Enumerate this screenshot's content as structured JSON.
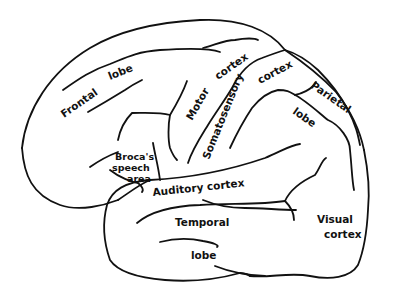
{
  "diagram": {
    "ink_color": "#111111",
    "background_color": "#ffffff",
    "labels": {
      "frontal_lobe_1": "Frontal",
      "frontal_lobe_2": "lobe",
      "motor_cortex_1": "Motor",
      "motor_cortex_2": "cortex",
      "somatosensory_cortex_1": "Somatosensory",
      "somatosensory_cortex_2": "cortex",
      "parietal_lobe_1": "Parietal",
      "parietal_lobe_2": "lobe",
      "brocas_area_1": "Broca's",
      "brocas_area_2": "speech",
      "brocas_area_3": "area",
      "auditory_cortex": "Auditory cortex",
      "temporal_lobe_1": "Temporal",
      "temporal_lobe_2": "lobe",
      "visual_cortex_1": "Visual",
      "visual_cortex_2": "cortex"
    }
  }
}
